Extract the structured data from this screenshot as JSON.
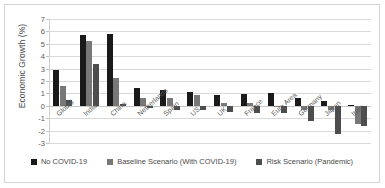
{
  "chart_data": {
    "type": "bar",
    "title": "",
    "xlabel": "",
    "ylabel": "Economic Growth (%)",
    "ylim": [
      -3,
      7
    ],
    "yticks": [
      7,
      6,
      5,
      4,
      3,
      2,
      1,
      0,
      -1,
      -2,
      -3
    ],
    "grid": true,
    "legend_position": "bottom",
    "categories": [
      "Global",
      "India",
      "China",
      "Netherlands",
      "Spain",
      "US",
      "UK",
      "France",
      "Euro Area",
      "Germany",
      "Japan",
      "Italy"
    ],
    "series": [
      {
        "name": "No COVID-19",
        "color": "#1a1a1a",
        "values": [
          2.9,
          5.7,
          5.8,
          1.4,
          1.25,
          1.15,
          0.9,
          0.95,
          1.05,
          0.6,
          0.4,
          0.05
        ]
      },
      {
        "name": "Baseline Scenario (With COVID-19)",
        "color": "#787878",
        "values": [
          1.6,
          5.2,
          2.25,
          0.6,
          0.65,
          0.85,
          0.25,
          0.2,
          -0.05,
          -0.3,
          -0.35,
          -1.5
        ]
      },
      {
        "name": "Risk Scenario (Pandemic)",
        "color": "#4d4d4d",
        "values": [
          0.45,
          3.4,
          0.15,
          -0.2,
          -0.3,
          -0.35,
          -0.5,
          -0.6,
          -0.6,
          -1.2,
          -2.3,
          -1.6
        ]
      }
    ]
  },
  "legend": {
    "items": [
      {
        "label": "No COVID-19",
        "color": "#1a1a1a"
      },
      {
        "label": "Baseline Scenario (With COVID-19)",
        "color": "#787878"
      },
      {
        "label": "Risk Scenario (Pandemic)",
        "color": "#4d4d4d"
      }
    ]
  }
}
